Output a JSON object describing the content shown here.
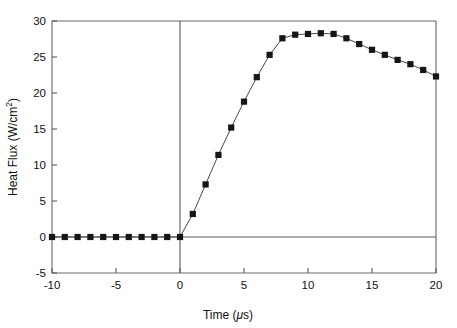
{
  "chart_data": {
    "type": "line",
    "title": "",
    "xlabel": "Time (μs)",
    "ylabel": "Heat Flux (W/cm²)",
    "xlabel_parts": {
      "name": "Time",
      "unit_open": "(",
      "unit_symbol": "μs",
      "unit_close": ")"
    },
    "ylabel_parts": {
      "name": "Heat Flux",
      "unit_open": "(W/cm",
      "unit_sup": "2",
      "unit_close": ")"
    },
    "xlim": [
      -10,
      20
    ],
    "ylim": [
      -5,
      30
    ],
    "xticks": [
      -10,
      -5,
      0,
      5,
      10,
      15,
      20
    ],
    "xtick_labels": [
      "-10",
      "-5",
      "0",
      "5",
      "10",
      "15",
      "20"
    ],
    "yticks": [
      -5,
      0,
      5,
      10,
      15,
      20,
      25,
      30
    ],
    "ytick_labels": [
      "-5",
      "0",
      "5",
      "10",
      "15",
      "20",
      "25",
      "30"
    ],
    "grid": false,
    "legend": null,
    "marker": "filled-square",
    "marker_color": "#151515",
    "line_color": "#4a4a4a",
    "reference_lines": [
      {
        "name": "vertical-zero-line",
        "axis": "x",
        "value": 0
      },
      {
        "name": "horizontal-zero-line",
        "axis": "y",
        "value": 0
      }
    ],
    "series": [
      {
        "name": "Heat Flux",
        "x": [
          -10,
          -9,
          -8,
          -7,
          -6,
          -5,
          -4,
          -3,
          -2,
          -1,
          0,
          1,
          2,
          3,
          4,
          5,
          6,
          7,
          8,
          9,
          10,
          11,
          12,
          13,
          14,
          15,
          16,
          17,
          18,
          19,
          20
        ],
        "values": [
          0,
          0,
          0,
          0,
          0,
          0,
          0,
          0,
          0,
          0,
          0,
          3.2,
          7.3,
          11.4,
          15.2,
          18.8,
          22.2,
          25.3,
          27.6,
          28.1,
          28.2,
          28.3,
          28.2,
          27.6,
          26.8,
          26.0,
          25.3,
          24.6,
          24.0,
          23.2,
          22.3
        ]
      }
    ]
  }
}
